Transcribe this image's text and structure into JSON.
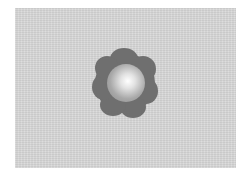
{
  "image": {
    "background_color": "#d6d6d6",
    "ring_color": "#6f6f6f",
    "core_highlight_color": "#ffffff",
    "subject": "round-lobed-particle"
  }
}
